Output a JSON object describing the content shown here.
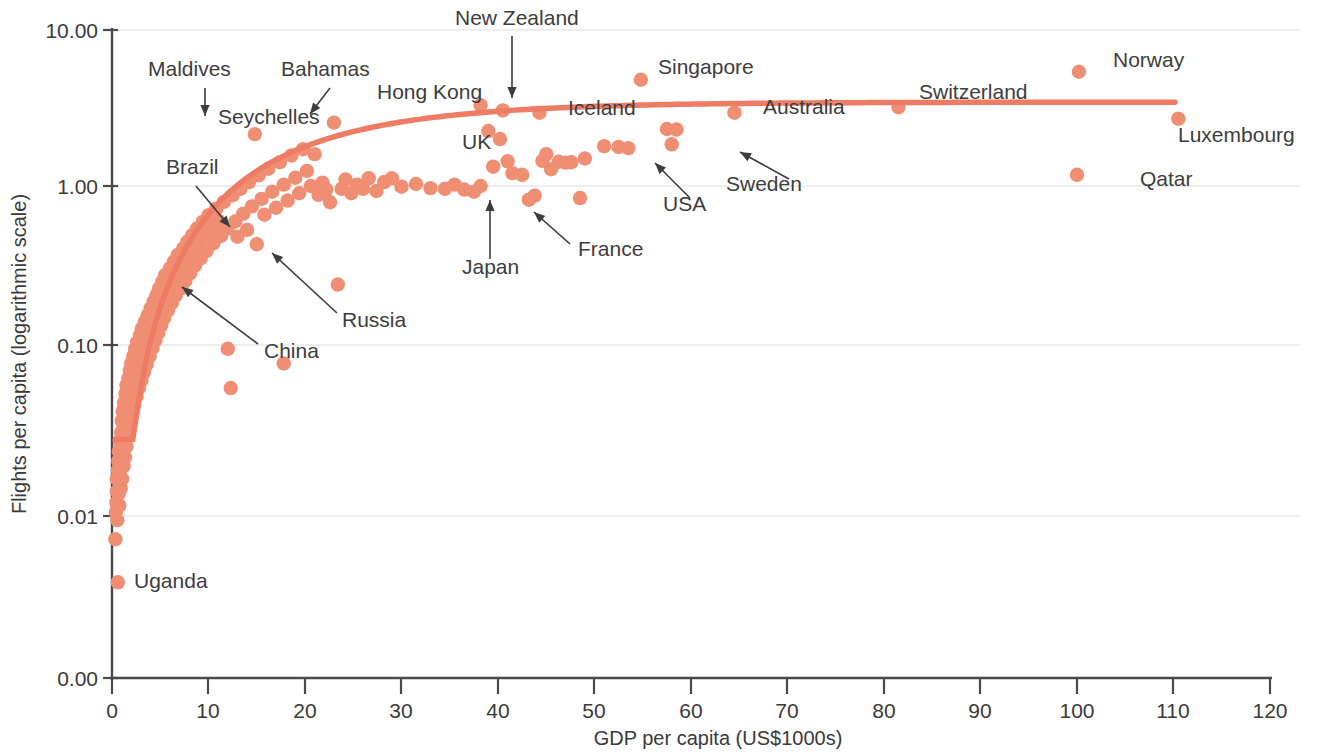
{
  "chart_data": {
    "type": "scatter",
    "title": "",
    "xlabel": "GDP per capita (US$1000s)",
    "ylabel": "Flights per capita (logarithmic scale)",
    "xlim": [
      0,
      120
    ],
    "ylim_labels": [
      "0.00",
      "0.01",
      "0.10",
      "1.00",
      "10.00"
    ],
    "yscale": "log",
    "grid": "horizontal-only",
    "legend": "none",
    "point_color": "#F08E73",
    "trend_color": "#EE7B63",
    "axis_color": "#4a4a4a",
    "xticks": [
      0,
      10,
      20,
      30,
      40,
      50,
      60,
      70,
      80,
      90,
      100,
      110,
      120
    ],
    "yticks": [
      "10.00",
      "1.00",
      "0.10",
      "0.01",
      "0.00"
    ],
    "labeled_points": [
      {
        "name": "Maldives",
        "x": 6.2,
        "y": 2.95
      },
      {
        "name": "Bahamas",
        "x": 23.0,
        "y": 2.55
      },
      {
        "name": "Seychelles",
        "x": 14.8,
        "y": 2.15
      },
      {
        "name": "Hong Kong",
        "x": 38.2,
        "y": 3.3
      },
      {
        "name": "New Zealand",
        "x": 40.5,
        "y": 3.05
      },
      {
        "name": "Singapore",
        "x": 54.8,
        "y": 4.8
      },
      {
        "name": "Iceland",
        "x": 44.3,
        "y": 2.95
      },
      {
        "name": "Australia",
        "x": 64.5,
        "y": 2.95
      },
      {
        "name": "Switzerland",
        "x": 81.5,
        "y": 3.2
      },
      {
        "name": "Norway",
        "x": 100.2,
        "y": 5.4
      },
      {
        "name": "Luxembourg",
        "x": 110.5,
        "y": 2.7
      },
      {
        "name": "Qatar",
        "x": 100.0,
        "y": 1.18
      },
      {
        "name": "UK",
        "x": 40.2,
        "y": 2.0
      },
      {
        "name": "USA",
        "x": 52.5,
        "y": 1.78
      },
      {
        "name": "Sweden",
        "x": 58.0,
        "y": 1.85
      },
      {
        "name": "Japan",
        "x": 38.2,
        "y": 1.0
      },
      {
        "name": "France",
        "x": 43.2,
        "y": 0.82
      },
      {
        "name": "Brazil",
        "x": 11.0,
        "y": 0.5
      },
      {
        "name": "Russia",
        "x": 15.0,
        "y": 0.43
      },
      {
        "name": "China",
        "x": 7.0,
        "y": 0.245
      },
      {
        "name": "Uganda",
        "x": 0.6,
        "y": 0.0044
      }
    ],
    "annotations": [
      {
        "label": "Maldives",
        "text_x": 148,
        "text_y": 76,
        "arrow": [
          205,
          88,
          205,
          116
        ]
      },
      {
        "label": "Bahamas",
        "text_x": 281,
        "text_y": 76,
        "arrow": [
          330,
          88,
          310,
          114
        ]
      },
      {
        "label": "Seychelles",
        "text_x": 218,
        "text_y": 124,
        "arrow": null
      },
      {
        "label": "Hong Kong",
        "text_x": 377,
        "text_y": 99,
        "arrow": null
      },
      {
        "label": "New Zealand",
        "text_x": 455,
        "text_y": 25,
        "arrow": [
          512,
          36,
          512,
          98
        ]
      },
      {
        "label": "Singapore",
        "text_x": 658,
        "text_y": 74,
        "arrow": null
      },
      {
        "label": "Iceland",
        "text_x": 568,
        "text_y": 115,
        "arrow": null
      },
      {
        "label": "Australia",
        "text_x": 763,
        "text_y": 114,
        "arrow": null
      },
      {
        "label": "Switzerland",
        "text_x": 919,
        "text_y": 99,
        "arrow": null
      },
      {
        "label": "Norway",
        "text_x": 1113,
        "text_y": 67,
        "arrow": null
      },
      {
        "label": "Luxembourg",
        "text_x": 1178,
        "text_y": 142,
        "arrow": null
      },
      {
        "label": "Qatar",
        "text_x": 1140,
        "text_y": 186,
        "arrow": null
      },
      {
        "label": "UK",
        "text_x": 462,
        "text_y": 149,
        "arrow": null
      },
      {
        "label": "USA",
        "text_x": 663,
        "text_y": 211,
        "arrow": [
          690,
          198,
          655,
          163
        ]
      },
      {
        "label": "Sweden",
        "text_x": 726,
        "text_y": 191,
        "arrow": [
          789,
          179,
          740,
          152
        ]
      },
      {
        "label": "Japan",
        "text_x": 462,
        "text_y": 274,
        "arrow": [
          490,
          259,
          490,
          200
        ]
      },
      {
        "label": "France",
        "text_x": 578,
        "text_y": 256,
        "arrow": [
          570,
          244,
          534,
          212
        ]
      },
      {
        "label": "Brazil",
        "text_x": 166,
        "text_y": 174,
        "arrow": [
          196,
          186,
          230,
          227
        ]
      },
      {
        "label": "Russia",
        "text_x": 342,
        "text_y": 327,
        "arrow": [
          337,
          313,
          272,
          253
        ]
      },
      {
        "label": "China",
        "text_x": 264,
        "text_y": 358,
        "arrow": [
          258,
          344,
          182,
          287
        ]
      },
      {
        "label": "Uganda",
        "text_x": 134,
        "text_y": 588,
        "arrow": null
      }
    ],
    "trend_line_note": "Rising logarithmic fit from (0.4, 0.028) flattening to ~3.4 at GDP 110",
    "n_points_approx": 190
  }
}
